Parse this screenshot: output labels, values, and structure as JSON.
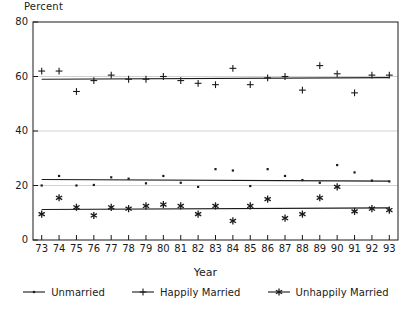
{
  "chart_data": {
    "type": "scatter",
    "title": "",
    "xlabel": "Year",
    "ylabel": "Percent",
    "ylim": [
      0,
      80
    ],
    "yticks": [
      0,
      20,
      40,
      60,
      80
    ],
    "grid": true,
    "legend_position": "bottom",
    "x": [
      73,
      74,
      75,
      76,
      77,
      78,
      79,
      80,
      81,
      82,
      83,
      84,
      85,
      86,
      87,
      88,
      89,
      90,
      91,
      92,
      93
    ],
    "categories": [
      "73",
      "74",
      "75",
      "76",
      "77",
      "78",
      "79",
      "80",
      "81",
      "82",
      "83",
      "84",
      "85",
      "86",
      "87",
      "88",
      "89",
      "90",
      "91",
      "92",
      "93"
    ],
    "series": [
      {
        "name": "Unmarried",
        "marker": "dot",
        "values": [
          20.0,
          23.5,
          20.0,
          20.2,
          23.0,
          22.5,
          20.8,
          23.5,
          21.0,
          19.5,
          26.0,
          25.5,
          19.8,
          26.0,
          23.5,
          22.0,
          21.0,
          27.5,
          24.8,
          21.8,
          21.5
        ],
        "trend": [
          22.2,
          21.6
        ]
      },
      {
        "name": "Happily Married",
        "marker": "plus",
        "values": [
          62.0,
          62.0,
          54.5,
          58.5,
          60.5,
          59.0,
          59.0,
          60.0,
          58.5,
          57.5,
          57.0,
          63.0,
          57.0,
          59.5,
          60.0,
          55.0,
          64.0,
          61.0,
          54.0,
          60.5,
          60.5
        ],
        "trend": [
          59.0,
          59.6
        ]
      },
      {
        "name": "Unhappily Married",
        "marker": "asterisk",
        "values": [
          9.5,
          15.5,
          12.0,
          9.0,
          12.0,
          11.5,
          12.5,
          13.0,
          12.5,
          9.5,
          12.5,
          7.0,
          12.5,
          15.0,
          8.0,
          9.5,
          15.5,
          19.5,
          10.5,
          11.5,
          11.0
        ],
        "trend": [
          11.2,
          11.8
        ]
      }
    ]
  },
  "axes": {
    "ylabel": "Percent",
    "xlabel": "Year",
    "ytick_labels": [
      "0",
      "20",
      "40",
      "60",
      "80"
    ],
    "xtick_labels": [
      "73",
      "74",
      "75",
      "76",
      "77",
      "78",
      "79",
      "80",
      "81",
      "82",
      "83",
      "84",
      "85",
      "86",
      "87",
      "88",
      "89",
      "90",
      "91",
      "92",
      "93"
    ]
  },
  "legend": {
    "items": [
      {
        "label": "Unmarried",
        "marker": "dot"
      },
      {
        "label": "Happily Married",
        "marker": "plus"
      },
      {
        "label": "Unhappily Married",
        "marker": "asterisk"
      }
    ]
  },
  "colors": {
    "axis": "#1a1a1a",
    "grid": "#bdbdbd",
    "series": "#1a1a1a",
    "background": "#ffffff"
  }
}
